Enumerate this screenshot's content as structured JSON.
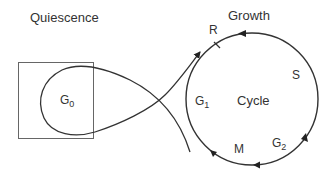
{
  "diagram": {
    "title_left": "Quiescence",
    "title_right": "Growth",
    "quiescent_state": {
      "base": "G",
      "sub": "0"
    },
    "cycle_label": "Cycle",
    "restriction_point": "R",
    "phases": [
      {
        "base": "G",
        "sub": "1"
      },
      {
        "base": "S",
        "sub": ""
      },
      {
        "base": "G",
        "sub": "2"
      },
      {
        "base": "M",
        "sub": ""
      }
    ],
    "colors": {
      "stroke": "#333333",
      "box": "#555555",
      "text": "#333333"
    }
  }
}
